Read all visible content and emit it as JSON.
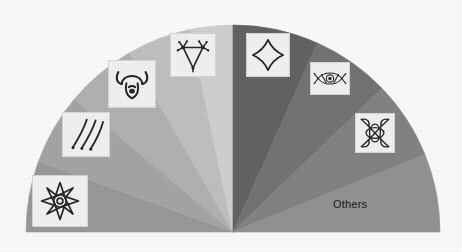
{
  "figure": {
    "type": "half-pie-chart",
    "background_color": "#fdfdfd",
    "center_x": 233,
    "center_y": 232,
    "radius": 207,
    "label_others": "Others"
  },
  "chart_data": {
    "type": "pie",
    "title": "",
    "subtitle": "",
    "xlabel": "",
    "ylabel": "",
    "layout": "semicircle",
    "start_angle_deg": 180,
    "end_angle_deg": 0,
    "direction": "clockwise",
    "legend_position": "in-slice-icons",
    "grid": false,
    "categories": [
      "eight-pointed-star-knot",
      "three-diagonal-strokes",
      "ram-head",
      "triangle-node-figure",
      "unlabeled-light-slice",
      "quatrefoil",
      "eye-vesica",
      "x-interlace-knot",
      "Others"
    ],
    "values": [
      20,
      20,
      20,
      20,
      20,
      24,
      24,
      22,
      20
    ],
    "slices": [
      {
        "name": "eight-pointed-star-knot",
        "icon": "eight-point-star-knot-icon",
        "start_deg": 180,
        "end_deg": 160,
        "color": "#9b9b9b",
        "icon_x": 32,
        "icon_y": 175,
        "icon_w": 56,
        "icon_h": 52,
        "label": ""
      },
      {
        "name": "three-diagonal-strokes",
        "icon": "three-strokes-icon",
        "start_deg": 160,
        "end_deg": 140,
        "color": "#a7a7a7",
        "icon_x": 62,
        "icon_y": 112,
        "icon_w": 48,
        "icon_h": 45,
        "label": ""
      },
      {
        "name": "ram-head",
        "icon": "ram-head-icon",
        "start_deg": 140,
        "end_deg": 120,
        "color": "#b3b3b3",
        "icon_x": 108,
        "icon_y": 60,
        "icon_w": 48,
        "icon_h": 48,
        "label": ""
      },
      {
        "name": "triangle-node-figure",
        "icon": "triangle-node-icon",
        "start_deg": 120,
        "end_deg": 102,
        "color": "#c2c2c2",
        "icon_x": 170,
        "icon_y": 33,
        "icon_w": 46,
        "icon_h": 44,
        "label": ""
      },
      {
        "name": "unlabeled-light-slice",
        "icon": "",
        "start_deg": 102,
        "end_deg": 90,
        "color": "#d2d2d2",
        "icon_x": 0,
        "icon_y": 0,
        "icon_w": 0,
        "icon_h": 0,
        "label": ""
      },
      {
        "name": "quatrefoil",
        "icon": "quatrefoil-icon",
        "start_deg": 90,
        "end_deg": 66,
        "color": "#646464",
        "icon_x": 246,
        "icon_y": 33,
        "icon_w": 44,
        "icon_h": 44,
        "label": ""
      },
      {
        "name": "eye-vesica",
        "icon": "eye-vesica-icon",
        "start_deg": 66,
        "end_deg": 44,
        "color": "#757575",
        "icon_x": 310,
        "icon_y": 62,
        "icon_w": 40,
        "icon_h": 33,
        "label": ""
      },
      {
        "name": "x-interlace-knot",
        "icon": "x-knot-icon",
        "start_deg": 44,
        "end_deg": 22,
        "color": "#848484",
        "icon_x": 355,
        "icon_y": 113,
        "icon_w": 40,
        "icon_h": 40,
        "label": ""
      },
      {
        "name": "others",
        "icon": "",
        "start_deg": 22,
        "end_deg": 0,
        "color": "#949494",
        "icon_x": 0,
        "icon_y": 0,
        "icon_w": 0,
        "icon_h": 0,
        "label": "Others"
      }
    ],
    "others_label_x": 333,
    "others_label_y": 198
  }
}
